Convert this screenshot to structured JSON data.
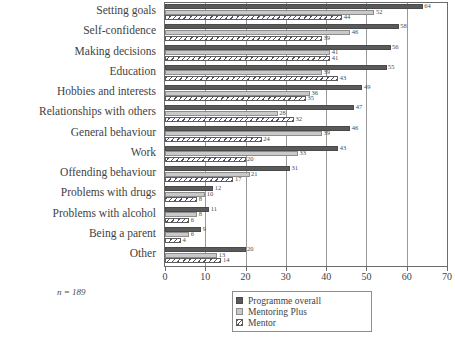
{
  "chart_data": {
    "type": "bar",
    "orientation": "horizontal",
    "title": "",
    "xlabel": "",
    "ylabel": "",
    "xlim": [
      0,
      70
    ],
    "xticks": [
      0,
      10,
      20,
      30,
      40,
      50,
      60,
      70
    ],
    "grid": true,
    "legend_position": "bottom-right",
    "categories": [
      "Setting goals",
      "Self-confidence",
      "Making decisions",
      "Education",
      "Hobbies and interests",
      "Relationships with others",
      "General behaviour",
      "Work",
      "Offending behaviour",
      "Problems with drugs",
      "Problems with alcohol",
      "Being a parent",
      "Other"
    ],
    "series": [
      {
        "name": "Programme overall",
        "color": "#5a5a5a",
        "values": [
          64,
          58,
          56,
          55,
          49,
          47,
          46,
          43,
          31,
          12,
          11,
          9,
          20
        ]
      },
      {
        "name": "Mentoring Plus",
        "color": "#c9c9c9",
        "values": [
          52,
          46,
          41,
          39,
          36,
          28,
          39,
          33,
          21,
          10,
          8,
          6,
          13
        ]
      },
      {
        "name": "Mentor",
        "color": "#ffffff",
        "values": [
          44,
          39,
          41,
          43,
          35,
          32,
          24,
          20,
          17,
          8,
          6,
          4,
          14
        ]
      }
    ],
    "note": "n = 189"
  },
  "legend": {
    "items": [
      {
        "label": "Programme overall"
      },
      {
        "label": "Mentoring Plus"
      },
      {
        "label": "Mentor"
      }
    ]
  }
}
